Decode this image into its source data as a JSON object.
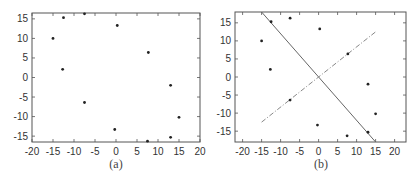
{
  "chart_data": [
    {
      "type": "scatter",
      "title": "",
      "caption": "(a)",
      "xlabel": "",
      "ylabel": "",
      "xlim": [
        -20,
        20
      ],
      "ylim": [
        -16.5,
        16.5
      ],
      "xticks": [
        -20,
        -15,
        -10,
        -5,
        0,
        5,
        10,
        15,
        20
      ],
      "yticks": [
        -15,
        -10,
        -5,
        0,
        5,
        10,
        15
      ],
      "grid": false,
      "points": [
        {
          "x": -12.5,
          "y": 15.3
        },
        {
          "x": -7.5,
          "y": 16.3
        },
        {
          "x": 0.3,
          "y": 13.3
        },
        {
          "x": -15,
          "y": 10
        },
        {
          "x": 7.7,
          "y": 6.4
        },
        {
          "x": -12.7,
          "y": 2.1
        },
        {
          "x": 13,
          "y": -2
        },
        {
          "x": -7.5,
          "y": -6.4
        },
        {
          "x": 15,
          "y": -10.2
        },
        {
          "x": -0.3,
          "y": -13.3
        },
        {
          "x": 13,
          "y": -15.3
        },
        {
          "x": 7.5,
          "y": -16.3
        }
      ]
    },
    {
      "type": "scatter",
      "title": "",
      "caption": "(b)",
      "xlabel": "",
      "ylabel": "",
      "xlim": [
        -22,
        23
      ],
      "ylim": [
        -18,
        18
      ],
      "xticks": [
        -20,
        -15,
        -10,
        -5,
        0,
        5,
        10,
        15,
        20
      ],
      "yticks": [
        -15,
        -10,
        -5,
        0,
        5,
        10,
        15
      ],
      "grid": false,
      "points": [
        {
          "x": -12.5,
          "y": 15.3
        },
        {
          "x": -7.5,
          "y": 16.3
        },
        {
          "x": 0.3,
          "y": 13.3
        },
        {
          "x": -15,
          "y": 10
        },
        {
          "x": 7.7,
          "y": 6.4
        },
        {
          "x": -12.7,
          "y": 2.1
        },
        {
          "x": 13,
          "y": -2
        },
        {
          "x": -7.5,
          "y": -6.4
        },
        {
          "x": 15,
          "y": -10.2
        },
        {
          "x": -0.3,
          "y": -13.3
        },
        {
          "x": 13,
          "y": -15.3
        },
        {
          "x": 7.5,
          "y": -16.3
        }
      ],
      "lines": [
        {
          "style": "solid",
          "from": {
            "x": -15,
            "y": 18
          },
          "to": {
            "x": 15,
            "y": -18
          }
        },
        {
          "style": "dash-dot",
          "from": {
            "x": -15,
            "y": -12.5
          },
          "to": {
            "x": 15,
            "y": 12.5
          }
        }
      ]
    }
  ],
  "colors": {
    "axis": "#555555",
    "points": "#222222",
    "solid_line": "#666666",
    "dashed_line": "#888888"
  }
}
